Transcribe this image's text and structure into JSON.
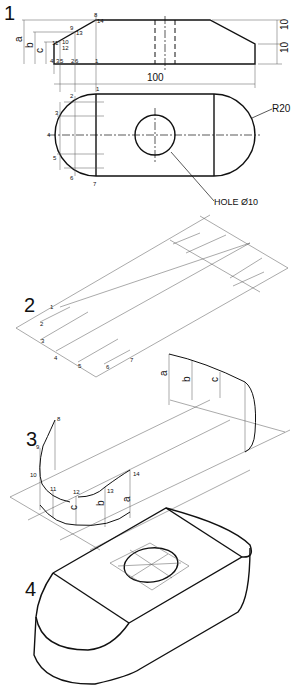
{
  "steps": {
    "s1": "1",
    "s2": "2",
    "s3": "3",
    "s4": "4"
  },
  "view1": {
    "dim_length": "100",
    "dim_h1": "10",
    "dim_h2": "10",
    "radius": "R20",
    "hole": "HOLE Ø10",
    "letters": {
      "a": "a",
      "b": "b",
      "c": "c"
    },
    "profile_points": [
      "1",
      "2",
      "3",
      "4",
      "5",
      "6",
      "7",
      "8",
      "9",
      "10",
      "11",
      "12",
      "13",
      "14"
    ],
    "plan_points": [
      "1",
      "2",
      "3",
      "4",
      "5",
      "6",
      "7"
    ]
  },
  "view2": {
    "points": [
      "1",
      "2",
      "3",
      "4",
      "5",
      "6",
      "7"
    ]
  },
  "view3": {
    "points": [
      "8",
      "9",
      "10",
      "11",
      "12",
      "13",
      "14"
    ],
    "letters": {
      "a": "a",
      "b": "b",
      "c": "c"
    }
  }
}
